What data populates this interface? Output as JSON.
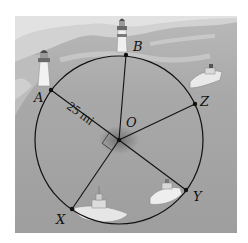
{
  "figure": {
    "center_label": "O",
    "radius_label": "25 mi",
    "points": [
      {
        "label": "A",
        "x": 51,
        "y": 90
      },
      {
        "label": "B",
        "x": 126,
        "y": 55
      },
      {
        "label": "Z",
        "x": 195,
        "y": 104
      },
      {
        "label": "Y",
        "x": 186,
        "y": 190
      },
      {
        "label": "X",
        "x": 72,
        "y": 209
      }
    ],
    "right_angle_between": [
      "OA",
      "OX"
    ],
    "scene": {
      "lighthouses": 2,
      "boats": 3
    }
  }
}
